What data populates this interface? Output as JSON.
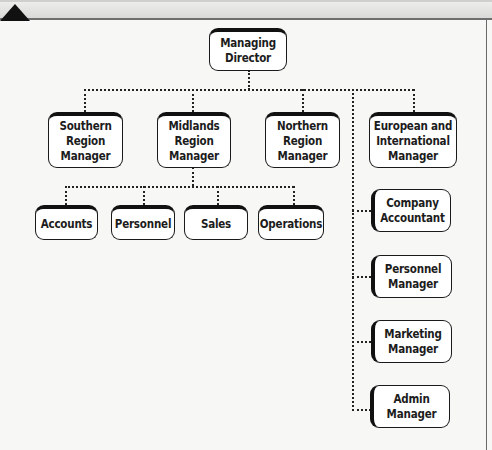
{
  "diagram": {
    "type": "organisation-chart",
    "root": {
      "id": "md",
      "label": "Managing\nDirector"
    },
    "level1": [
      {
        "id": "south",
        "label": "Southern\nRegion\nManager"
      },
      {
        "id": "mid",
        "label": "Midlands\nRegion\nManager"
      },
      {
        "id": "north",
        "label": "Northern\nRegion\nManager"
      },
      {
        "id": "euro",
        "label": "European and\nInternational\nManager"
      }
    ],
    "midlands_departments": [
      {
        "id": "accounts",
        "label": "Accounts"
      },
      {
        "id": "personnel",
        "label": "Personnel"
      },
      {
        "id": "sales",
        "label": "Sales"
      },
      {
        "id": "operations",
        "label": "Operations"
      }
    ],
    "head_office_staff": [
      {
        "id": "company-accountant",
        "label": "Company\nAccountant"
      },
      {
        "id": "personnel-manager",
        "label": "Personnel\nManager"
      },
      {
        "id": "marketing-manager",
        "label": "Marketing\nManager"
      },
      {
        "id": "admin-manager",
        "label": "Admin\nManager"
      }
    ],
    "edges": [
      [
        "md",
        "south"
      ],
      [
        "md",
        "mid"
      ],
      [
        "md",
        "north"
      ],
      [
        "md",
        "euro"
      ],
      [
        "mid",
        "accounts"
      ],
      [
        "mid",
        "personnel"
      ],
      [
        "mid",
        "sales"
      ],
      [
        "mid",
        "operations"
      ],
      [
        "md",
        "company-accountant"
      ],
      [
        "md",
        "personnel-manager"
      ],
      [
        "md",
        "marketing-manager"
      ],
      [
        "md",
        "admin-manager"
      ]
    ],
    "colors": {
      "box_fill": "#ffffff",
      "box_border": "#1a1a1a",
      "connector": "#222222",
      "page": "#f7f7f5"
    }
  }
}
